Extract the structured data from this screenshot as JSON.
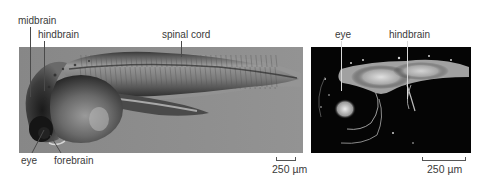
{
  "figure": {
    "left_panel": {
      "description": "brightfield image of zebrafish embryo",
      "labels": {
        "midbrain": "midbrain",
        "hindbrain": "hindbrain",
        "spinal_cord": "spinal cord",
        "eye": "eye",
        "forebrain": "forebrain"
      },
      "scale_bar": "250 µm"
    },
    "right_panel": {
      "description": "fluorescence image of embryo head",
      "labels": {
        "eye": "eye",
        "hindbrain": "hindbrain"
      },
      "scale_bar": "250 µm"
    },
    "colors": {
      "left_background": "#8c8c8c",
      "right_background": "#050505",
      "label_text": "#3a3a3a"
    }
  }
}
